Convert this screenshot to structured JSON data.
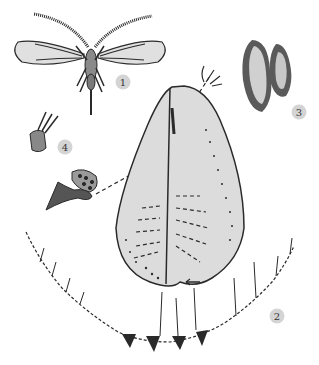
{
  "figure": {
    "background": "#ffffff",
    "ink": "#2a2a2a",
    "fill_gray": "#d9d9d9",
    "labels": [
      {
        "id": "1",
        "text": "1",
        "subject": "winged adult male"
      },
      {
        "id": "2",
        "text": "2",
        "subject": "pupal case margin detail"
      },
      {
        "id": "3",
        "text": "3",
        "subject": "waxy covered pupae"
      },
      {
        "id": "4",
        "text": "4",
        "subject": "marginal setae and vasiform orifice details"
      }
    ]
  }
}
